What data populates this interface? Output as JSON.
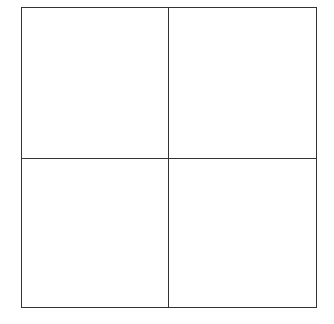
{
  "diagram": {
    "type": "grid",
    "rows": 2,
    "columns": 2,
    "line_color": "#333333",
    "background": "#ffffff",
    "cells": [
      {
        "position": "top-left",
        "label": ""
      },
      {
        "position": "top-right",
        "label": ""
      },
      {
        "position": "bottom-left",
        "label": ""
      },
      {
        "position": "bottom-right",
        "label": ""
      }
    ]
  }
}
